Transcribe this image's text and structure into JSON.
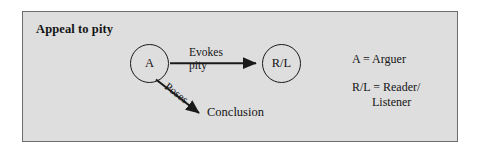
{
  "panel": {
    "title": "Appeal to pity",
    "background_color": "#dedede",
    "border_color": "#6d6d6d"
  },
  "diagram": {
    "type": "argument-flow-diagram",
    "nodes": [
      {
        "id": "arguer",
        "label": "A",
        "shape": "circle"
      },
      {
        "id": "reader-listener",
        "label": "R/L",
        "shape": "circle"
      },
      {
        "id": "conclusion",
        "label": "Conclusion",
        "shape": "text"
      }
    ],
    "edges": [
      {
        "id": "evokes-pity",
        "from": "arguer",
        "to": "reader-listener",
        "label_line1": "Evokes",
        "label_line2": "pity",
        "style": "solid-arrow"
      },
      {
        "id": "poses",
        "from": "arguer",
        "to": "conclusion",
        "label_line1": "Poses",
        "style": "solid-arrow-diagonal"
      }
    ]
  },
  "legend": {
    "entries": [
      {
        "term": "A = Arguer"
      },
      {
        "term": "R/L = Reader/",
        "continuation": "Listener"
      }
    ]
  },
  "colors": {
    "ink": "#141414",
    "stroke": "#1a1a1a",
    "panel_fill": "#dedede",
    "page": "#ffffff"
  }
}
